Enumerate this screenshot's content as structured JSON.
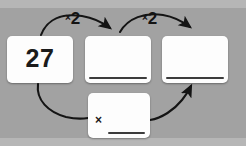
{
  "canvas": {
    "width": 246,
    "height": 146,
    "background_color": "#a2a2a2",
    "band_color": "#b6b6b6"
  },
  "diagram": {
    "type": "flow-chain",
    "card_fill": "#fdfdfd",
    "ink_color": "#141414",
    "cards": [
      {
        "id": "start",
        "name": "starting-number-card",
        "value": "27",
        "has_answer_line": false,
        "filled": true
      },
      {
        "id": "step1",
        "name": "first-double-card",
        "value": "",
        "has_answer_line": true,
        "filled": false
      },
      {
        "id": "step2",
        "name": "second-double-card",
        "value": "",
        "has_answer_line": true,
        "filled": false
      },
      {
        "id": "total",
        "name": "multiplication-total-card",
        "value": "",
        "operator": "×",
        "has_answer_line": true,
        "filled": false
      }
    ],
    "operations": [
      {
        "id": "op1",
        "sign": "×",
        "number": "2"
      },
      {
        "id": "op2",
        "sign": "×",
        "number": "2"
      }
    ],
    "arrows": [
      {
        "name": "arrow-start-to-step1",
        "from": "start",
        "to": "step1",
        "style": "curved-over",
        "label": "op1"
      },
      {
        "name": "arrow-step1-to-step2",
        "from": "step1",
        "to": "step2",
        "style": "curved-over",
        "label": "op2"
      },
      {
        "name": "arrow-start-to-total",
        "from": "start",
        "to": "total",
        "style": "curved-under",
        "label": ""
      },
      {
        "name": "arrow-total-to-step2",
        "from": "total",
        "to": "step2",
        "style": "curved-under",
        "label": ""
      }
    ]
  }
}
